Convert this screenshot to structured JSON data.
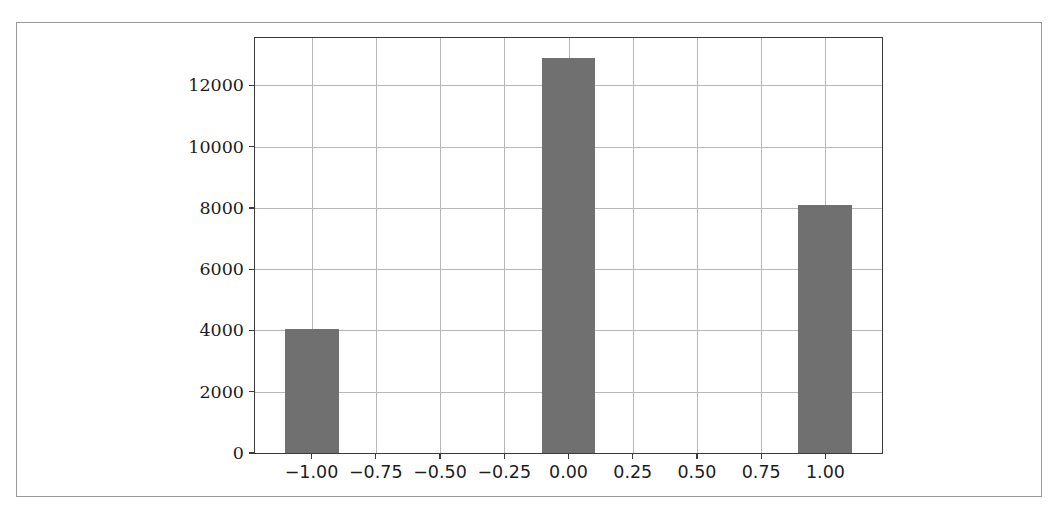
{
  "chart_data": {
    "type": "bar",
    "title": "",
    "subtitle": "",
    "xlabel": "",
    "ylabel": "",
    "x": [
      -1.0,
      0.0,
      1.0
    ],
    "categories": [
      "-1.00",
      "0.00",
      "1.00"
    ],
    "values": [
      4050,
      12900,
      8100
    ],
    "bar_width": 0.21,
    "series": [
      {
        "name": "counts",
        "values": [
          4050,
          12900,
          8100
        ]
      }
    ],
    "xlim": [
      -1.22,
      1.22
    ],
    "ylim": [
      0,
      13550
    ],
    "xticks": [
      -1.0,
      -0.75,
      -0.5,
      -0.25,
      0.0,
      0.25,
      0.5,
      0.75,
      1.0
    ],
    "xtick_labels": [
      "−1.00",
      "−0.75",
      "−0.50",
      "−0.25",
      "0.00",
      "0.25",
      "0.50",
      "0.75",
      "1.00"
    ],
    "yticks": [
      0,
      2000,
      4000,
      6000,
      8000,
      10000,
      12000
    ],
    "ytick_labels": [
      "0",
      "2000",
      "4000",
      "6000",
      "8000",
      "10000",
      "12000"
    ],
    "grid": true,
    "grid_axis": "both",
    "legend": null,
    "legend_position": "none",
    "annotations": []
  },
  "style": {
    "bar_color": "#707070",
    "grid_color": "#b8b8b8",
    "axis_color": "#3b3b3b",
    "frame_color": "#9a9a9a",
    "background": "#ffffff",
    "tick_label_color": "#1d1d1d"
  }
}
